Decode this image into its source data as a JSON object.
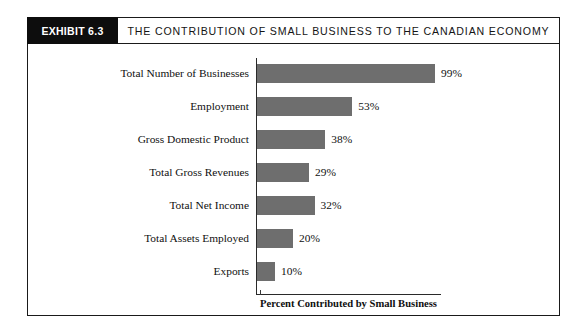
{
  "exhibit": {
    "badge_label": "EXHIBIT 6.3",
    "title": "THE CONTRIBUTION OF SMALL BUSINESS TO THE CANADIAN ECONOMY"
  },
  "chart_data": {
    "type": "bar",
    "orientation": "horizontal",
    "title": "THE CONTRIBUTION OF SMALL BUSINESS TO THE CANADIAN ECONOMY",
    "xlabel": "Percent Contributed by Small Business",
    "ylabel": "",
    "xlim": [
      0,
      100
    ],
    "grid": false,
    "legend": false,
    "bar_color": "#6e6e6e",
    "categories": [
      "Total Number of Businesses",
      "Employment",
      "Gross Domestic Product",
      "Total Gross Revenues",
      "Total Net Income",
      "Total Assets Employed",
      "Exports"
    ],
    "values": [
      99,
      53,
      38,
      29,
      32,
      20,
      10
    ],
    "value_labels": [
      "99%",
      "53%",
      "38%",
      "29%",
      "32%",
      "20%",
      "10%"
    ]
  }
}
